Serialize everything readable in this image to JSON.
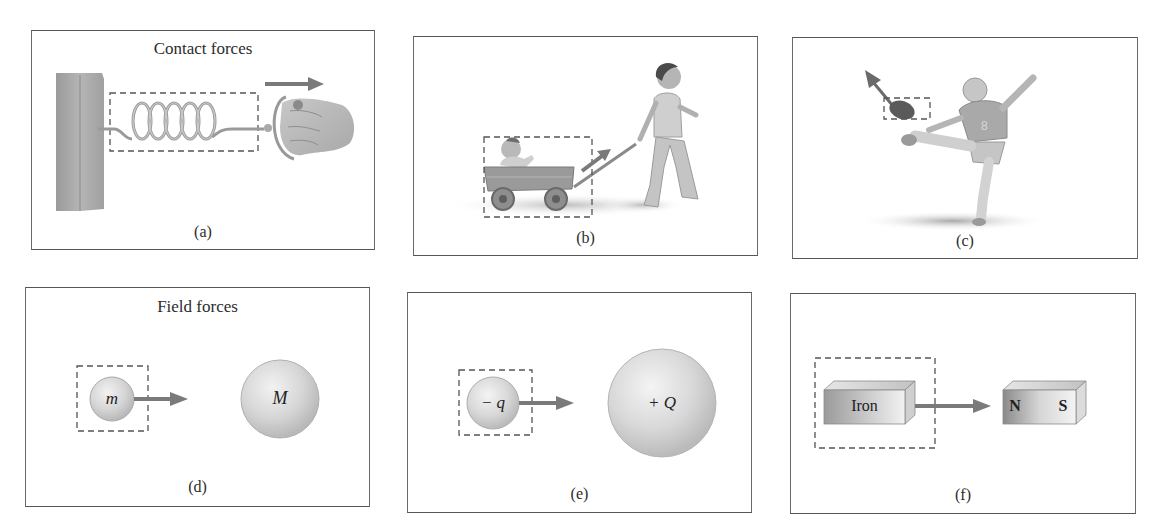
{
  "figure": {
    "groups": {
      "contact": "Contact forces",
      "field": "Field forces"
    },
    "panels": [
      {
        "id": "a",
        "caption": "(a)",
        "description": "Hand pulling a spring attached to a wall"
      },
      {
        "id": "b",
        "caption": "(b)",
        "description": "Child pulling a wagon carrying a baby"
      },
      {
        "id": "c",
        "caption": "(c)",
        "description": "Football player kicking a football"
      },
      {
        "id": "d",
        "caption": "(d)",
        "small_mass_label": "m",
        "large_mass_label": "M"
      },
      {
        "id": "e",
        "caption": "(e)",
        "small_charge_label": "− q",
        "large_charge_label": "+ Q"
      },
      {
        "id": "f",
        "caption": "(f)",
        "block_label": "Iron",
        "magnet_north": "N",
        "magnet_south": "S"
      }
    ],
    "colors": {
      "arrow": "#7a7a7a",
      "dashed_box": "#555555",
      "border": "#555555",
      "sphere_fill": "#d9d9d9"
    }
  }
}
